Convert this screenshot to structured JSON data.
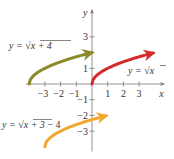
{
  "diagram": {
    "x_axis": {
      "label": "x",
      "range": [
        -4.2,
        4.1
      ],
      "ticks": [
        {
          "value": -3,
          "label": "−3"
        },
        {
          "value": -2,
          "label": "−2"
        },
        {
          "value": -1,
          "label": "−1"
        },
        {
          "value": 1,
          "label": "1"
        },
        {
          "value": 2,
          "label": "2"
        },
        {
          "value": 3,
          "label": "3"
        }
      ]
    },
    "y_axis": {
      "label": "y",
      "range": [
        -4.3,
        4.6
      ],
      "ticks": [
        {
          "value": 3,
          "label": "3"
        },
        {
          "value": 2,
          "label": ""
        },
        {
          "value": 1,
          "label": "1"
        },
        {
          "value": -1,
          "label": "−1"
        },
        {
          "value": -2,
          "label": "−2"
        },
        {
          "value": -3,
          "label": "−3"
        }
      ]
    },
    "curves": [
      {
        "name": "sqrt-x-plus-4",
        "label_prefix": "y = ",
        "label_radicand": "x + 4",
        "label_suffix": "",
        "h": -4,
        "k": 0,
        "x_start": -4,
        "x_end": 0,
        "color": "#8a8a2a"
      },
      {
        "name": "sqrt-x",
        "label_prefix": "y = ",
        "label_radicand": "x",
        "label_suffix": "",
        "h": 0,
        "k": 0,
        "x_start": 0,
        "x_end": 3.9,
        "color": "#d42a2a"
      },
      {
        "name": "sqrt-x-plus-3-minus-4",
        "label_prefix": "y = ",
        "label_radicand": "x + 3",
        "label_suffix": " − 4",
        "h": -3,
        "k": -4,
        "x_start": -3,
        "x_end": 0.9,
        "color": "#f0a830"
      }
    ]
  }
}
